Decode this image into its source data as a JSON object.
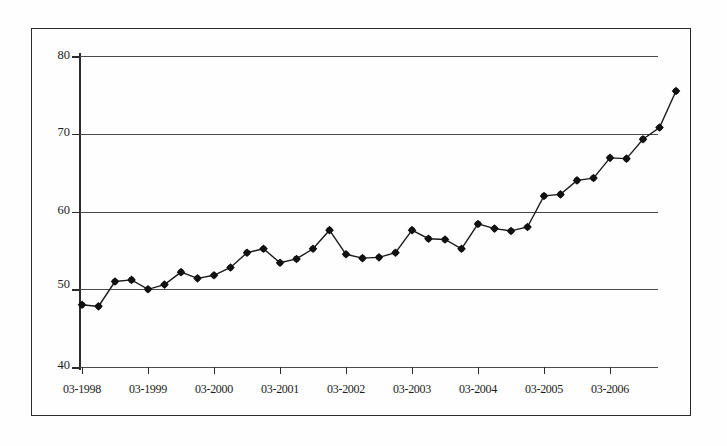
{
  "chart_data": {
    "type": "line",
    "title": "",
    "subtitle": "",
    "xlabel": "",
    "ylabel": "",
    "ylim": [
      40,
      80
    ],
    "y_ticks": [
      40,
      50,
      60,
      70,
      80
    ],
    "grid": true,
    "legend": "none",
    "marker": "filled-diamond",
    "x_tick_labels": [
      "03-1998",
      "03-1999",
      "03-2000",
      "03-2001",
      "03-2002",
      "03-2003",
      "03-2004",
      "03-2005",
      "03-2006"
    ],
    "x": [
      "03-1998",
      "06-1998",
      "09-1998",
      "12-1998",
      "03-1999",
      "06-1999",
      "09-1999",
      "12-1999",
      "03-2000",
      "06-2000",
      "09-2000",
      "12-2000",
      "03-2001",
      "06-2001",
      "09-2001",
      "12-2001",
      "03-2002",
      "06-2002",
      "09-2002",
      "12-2002",
      "03-2003",
      "06-2003",
      "09-2003",
      "12-2003",
      "03-2004",
      "06-2004",
      "09-2004",
      "12-2004",
      "03-2005",
      "06-2005",
      "09-2005",
      "12-2005",
      "03-2006",
      "06-2006",
      "09-2006"
    ],
    "series": [
      {
        "name": "series-1",
        "values": [
          48.0,
          47.8,
          51.0,
          51.2,
          50.0,
          50.6,
          52.2,
          51.4,
          51.8,
          52.8,
          54.7,
          55.2,
          53.4,
          53.9,
          55.2,
          57.6,
          54.5,
          54.0,
          54.1,
          54.7,
          57.6,
          56.5,
          56.4,
          55.2,
          58.4,
          57.8,
          57.5,
          58.0,
          62.0,
          62.2,
          64.0,
          64.3,
          66.9,
          66.8,
          69.3
        ]
      }
    ],
    "extra_points": [
      {
        "label": "12-2006",
        "value": 70.8
      },
      {
        "label": "03-2007",
        "value": 75.5
      }
    ]
  },
  "axes": {
    "y_labels": [
      "80",
      "70",
      "60",
      "50",
      "40"
    ]
  }
}
